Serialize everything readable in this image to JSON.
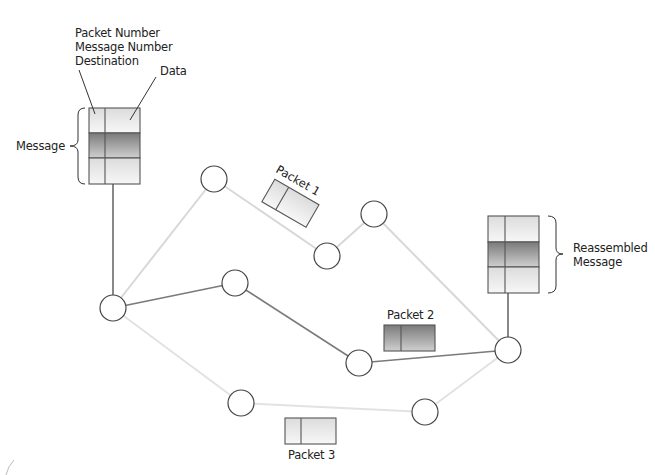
{
  "labels": {
    "packet_number": "Packet Number",
    "message_number": "Message Number",
    "destination": "Destination",
    "data": "Data",
    "message": "Message",
    "reassembled_line1": "Reassembled",
    "reassembled_line2": "Message",
    "packet1": "Packet 1",
    "packet2": "Packet 2",
    "packet3": "Packet 3"
  },
  "nodes": [
    {
      "id": "n-left",
      "x": 113,
      "y": 308
    },
    {
      "id": "n-top",
      "x": 214,
      "y": 179
    },
    {
      "id": "n-mid",
      "x": 235,
      "y": 283
    },
    {
      "id": "n-p1a",
      "x": 327,
      "y": 256
    },
    {
      "id": "n-p1b",
      "x": 374,
      "y": 214
    },
    {
      "id": "n-p2",
      "x": 359,
      "y": 363
    },
    {
      "id": "n-dest",
      "x": 508,
      "y": 350
    },
    {
      "id": "n-bot-left",
      "x": 241,
      "y": 403
    },
    {
      "id": "n-bot-right",
      "x": 425,
      "y": 412
    }
  ],
  "colors": {
    "dark_line": "#6a6a6a",
    "light_line": "#d8d8d8",
    "stroke": "#555555",
    "dark_fill": "#8c8c8c",
    "light_fill": "#ebebeb"
  }
}
